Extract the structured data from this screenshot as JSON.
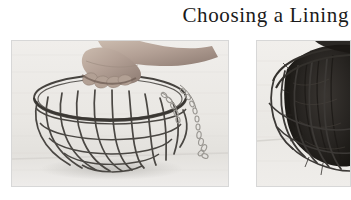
{
  "page": {
    "background_color": "#ffffff",
    "heading": "Choosing a Lining"
  },
  "figures": [
    {
      "id": "wire-basket-empty",
      "position": "left",
      "caption": "",
      "alt": "A hand gripping the rim of an empty wire hanging basket frame with a hanging chain",
      "subject": "wire hanging basket frame",
      "tone": "grayscale photograph",
      "background_color": "#eceae6",
      "wire_color": "#4a4743",
      "hand_color": "#b9a79a"
    },
    {
      "id": "wire-basket-lined",
      "position": "right",
      "caption": "",
      "alt": "A wire hanging basket lined with dark moss, cropped at the page edge",
      "subject": "wire basket lined with moss",
      "tone": "grayscale photograph",
      "background_color": "#eeece9",
      "wire_color": "#3c3936",
      "moss_color": "#262321"
    }
  ]
}
